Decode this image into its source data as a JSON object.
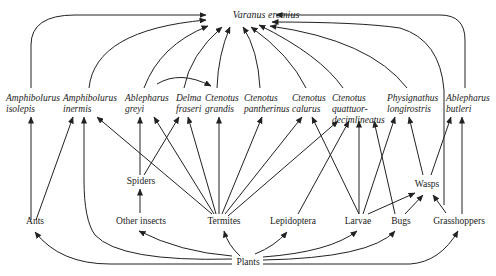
{
  "diagram": {
    "type": "food-web",
    "predator_top": {
      "id": "varanus",
      "label": "Varanus eremius"
    },
    "lizards": [
      {
        "id": "amph_iso",
        "line1": "Amphibolurus",
        "line2": "isolepis"
      },
      {
        "id": "amph_inerm",
        "line1": "Amphibolurus",
        "line2": "inermis"
      },
      {
        "id": "able_greyi",
        "line1": "Ablepharus",
        "line2": "greyi"
      },
      {
        "id": "delma",
        "line1": "Delma",
        "line2": "fraseri"
      },
      {
        "id": "cten_grandis",
        "line1": "Ctenotus",
        "line2": "grandis"
      },
      {
        "id": "cten_panth",
        "line1": "Ctenotus",
        "line2": "pantherinus"
      },
      {
        "id": "cten_cal",
        "line1": "Ctenotus",
        "line2": "calurus"
      },
      {
        "id": "cten_quat",
        "line1": "Ctenotus",
        "line2": "quattuor-",
        "line3": "decimlineatus"
      },
      {
        "id": "physig",
        "line1": "Physignathus",
        "line2": "longirostris"
      },
      {
        "id": "able_butleri",
        "line1": "Ablepharus",
        "line2": "butleri"
      }
    ],
    "invertebrates": [
      {
        "id": "spiders",
        "label": "Spiders"
      },
      {
        "id": "wasps",
        "label": "Wasps"
      },
      {
        "id": "ants",
        "label": "Ants"
      },
      {
        "id": "other_insects",
        "label": "Other insects"
      },
      {
        "id": "termites",
        "label": "Termites"
      },
      {
        "id": "lepidoptera",
        "label": "Lepidoptera"
      },
      {
        "id": "larvae",
        "label": "Larvae"
      },
      {
        "id": "bugs",
        "label": "Bugs"
      },
      {
        "id": "grasshoppers",
        "label": "Grasshoppers"
      }
    ],
    "base": {
      "id": "plants",
      "label": "Plants"
    },
    "edges": [
      [
        "amph_iso",
        "varanus"
      ],
      [
        "amph_inerm",
        "varanus"
      ],
      [
        "able_greyi",
        "varanus"
      ],
      [
        "delma",
        "varanus"
      ],
      [
        "cten_grandis",
        "varanus"
      ],
      [
        "cten_panth",
        "varanus"
      ],
      [
        "cten_cal",
        "varanus"
      ],
      [
        "cten_quat",
        "varanus"
      ],
      [
        "physig",
        "varanus"
      ],
      [
        "able_butleri",
        "varanus"
      ],
      [
        "grasshoppers",
        "varanus"
      ],
      [
        "able_greyi",
        "cten_grandis"
      ],
      [
        "ants",
        "amph_iso"
      ],
      [
        "ants",
        "amph_inerm"
      ],
      [
        "plants",
        "amph_inerm"
      ],
      [
        "termites",
        "amph_inerm"
      ],
      [
        "termites",
        "able_greyi"
      ],
      [
        "termites",
        "delma"
      ],
      [
        "termites",
        "cten_grandis"
      ],
      [
        "termites",
        "cten_panth"
      ],
      [
        "termites",
        "cten_cal"
      ],
      [
        "termites",
        "cten_quat"
      ],
      [
        "spiders",
        "able_greyi"
      ],
      [
        "spiders",
        "delma"
      ],
      [
        "other_insects",
        "spiders"
      ],
      [
        "lepidoptera",
        "cten_quat"
      ],
      [
        "larvae",
        "cten_cal"
      ],
      [
        "larvae",
        "cten_quat"
      ],
      [
        "larvae",
        "physig"
      ],
      [
        "larvae",
        "wasps"
      ],
      [
        "bugs",
        "cten_quat"
      ],
      [
        "bugs",
        "wasps"
      ],
      [
        "wasps",
        "physig"
      ],
      [
        "wasps",
        "able_butleri"
      ],
      [
        "grasshoppers",
        "wasps"
      ],
      [
        "grasshoppers",
        "able_butleri"
      ],
      [
        "plants",
        "ants"
      ],
      [
        "plants",
        "other_insects"
      ],
      [
        "plants",
        "termites"
      ],
      [
        "plants",
        "lepidoptera"
      ],
      [
        "plants",
        "larvae"
      ],
      [
        "plants",
        "bugs"
      ],
      [
        "plants",
        "grasshoppers"
      ]
    ]
  }
}
